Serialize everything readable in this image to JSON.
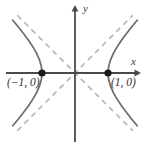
{
  "figure": {
    "width": 149,
    "height": 144,
    "background_color": "#ffffff"
  },
  "axes": {
    "x_label": "x",
    "y_label": "y",
    "axis_color": "#4a4a4a",
    "origin": {
      "x": 75,
      "y": 73
    },
    "x_axis": {
      "start_x": 6,
      "end_x": 141,
      "y": 73,
      "arrow": "right"
    },
    "y_axis": {
      "x": 75,
      "start_y": 5,
      "end_y": 142,
      "arrow": "up"
    }
  },
  "annotations": {
    "left_vertex_label": "(−1, 0)",
    "right_vertex_label": "(1, 0)",
    "vertex_dot_color": "#1a1a1a"
  },
  "chart_data": {
    "type": "line",
    "title": "",
    "subtitle": "",
    "xlabel": "x",
    "ylabel": "y",
    "grid": false,
    "legend": null,
    "xlim": [
      -2.1,
      2.0
    ],
    "ylim": [
      -2.05,
      2.05
    ],
    "curve_color": "#6b6b6b",
    "asymptote_color": "#b4b4b4",
    "equation": "x^2 - y^2 = 1",
    "vertices": [
      {
        "x": -1,
        "y": 0,
        "label": "(−1, 0)"
      },
      {
        "x": 1,
        "y": 0,
        "label": "(1, 0)"
      }
    ],
    "series": [
      {
        "name": "right branch",
        "style": "solid",
        "points": [
          {
            "x": 1.0,
            "y": 0.0
          },
          {
            "x": 1.02,
            "y": 0.2
          },
          {
            "x": 1.077,
            "y": 0.4
          },
          {
            "x": 1.166,
            "y": 0.6
          },
          {
            "x": 1.281,
            "y": 0.8
          },
          {
            "x": 1.414,
            "y": 1.0
          },
          {
            "x": 1.562,
            "y": 1.2
          },
          {
            "x": 1.72,
            "y": 1.4
          },
          {
            "x": 1.887,
            "y": 1.6
          },
          {
            "x": 1.0,
            "y": -0.0
          },
          {
            "x": 1.02,
            "y": -0.2
          },
          {
            "x": 1.077,
            "y": -0.4
          },
          {
            "x": 1.166,
            "y": -0.6
          },
          {
            "x": 1.281,
            "y": -0.8
          },
          {
            "x": 1.414,
            "y": -1.0
          },
          {
            "x": 1.562,
            "y": -1.2
          },
          {
            "x": 1.72,
            "y": -1.4
          },
          {
            "x": 1.887,
            "y": -1.6
          }
        ]
      },
      {
        "name": "left branch",
        "style": "solid",
        "points": [
          {
            "x": -1.0,
            "y": 0.0
          },
          {
            "x": -1.02,
            "y": 0.2
          },
          {
            "x": -1.077,
            "y": 0.4
          },
          {
            "x": -1.166,
            "y": 0.6
          },
          {
            "x": -1.281,
            "y": 0.8
          },
          {
            "x": -1.414,
            "y": 1.0
          },
          {
            "x": -1.562,
            "y": 1.2
          },
          {
            "x": -1.72,
            "y": 1.4
          },
          {
            "x": -1.887,
            "y": 1.6
          },
          {
            "x": -1.0,
            "y": -0.0
          },
          {
            "x": -1.02,
            "y": -0.2
          },
          {
            "x": -1.077,
            "y": -0.4
          },
          {
            "x": -1.166,
            "y": -0.6
          },
          {
            "x": -1.281,
            "y": -0.8
          },
          {
            "x": -1.414,
            "y": -1.0
          },
          {
            "x": -1.562,
            "y": -1.2
          },
          {
            "x": -1.72,
            "y": -1.4
          },
          {
            "x": -1.887,
            "y": -1.6
          }
        ]
      },
      {
        "name": "asymptote y = x",
        "style": "dashed",
        "points": [
          {
            "x": -1.75,
            "y": -1.75
          },
          {
            "x": 1.75,
            "y": 1.75
          }
        ]
      },
      {
        "name": "asymptote y = -x",
        "style": "dashed",
        "points": [
          {
            "x": -1.75,
            "y": 1.75
          },
          {
            "x": 1.75,
            "y": -1.75
          }
        ]
      }
    ]
  }
}
